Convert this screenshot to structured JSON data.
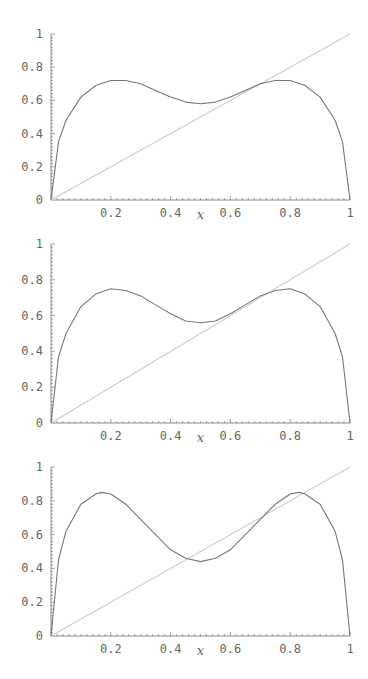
{
  "chart_data": [
    {
      "type": "line",
      "title": "",
      "xlabel": "x",
      "ylabel": "",
      "xlim": [
        0,
        1
      ],
      "ylim": [
        0,
        1
      ],
      "x_ticks": [
        "0.2",
        "0.4",
        "0.6",
        "0.8",
        "1"
      ],
      "y_ticks": [
        "0",
        "0.2",
        "0.4",
        "0.6",
        "0.8",
        "1"
      ],
      "grid": false,
      "series": [
        {
          "name": "f(x)",
          "color": "#777777",
          "x": [
            0,
            0.025,
            0.05,
            0.1,
            0.15,
            0.2,
            0.25,
            0.3,
            0.35,
            0.4,
            0.45,
            0.5,
            0.55,
            0.6,
            0.65,
            0.7,
            0.75,
            0.8,
            0.85,
            0.9,
            0.95,
            0.975,
            1
          ],
          "y": [
            0,
            0.35,
            0.48,
            0.62,
            0.69,
            0.72,
            0.72,
            0.7,
            0.66,
            0.62,
            0.59,
            0.58,
            0.59,
            0.62,
            0.66,
            0.7,
            0.72,
            0.72,
            0.69,
            0.62,
            0.48,
            0.35,
            0
          ]
        },
        {
          "name": "y = x",
          "color": "#cccccc",
          "x": [
            0,
            1
          ],
          "y": [
            0,
            1
          ]
        }
      ]
    },
    {
      "type": "line",
      "title": "",
      "xlabel": "x",
      "ylabel": "",
      "xlim": [
        0,
        1
      ],
      "ylim": [
        0,
        1
      ],
      "x_ticks": [
        "0.2",
        "0.4",
        "0.6",
        "0.8",
        "1"
      ],
      "y_ticks": [
        "0",
        "0.2",
        "0.4",
        "0.6",
        "0.8",
        "1"
      ],
      "grid": false,
      "series": [
        {
          "name": "f(x)",
          "color": "#777777",
          "x": [
            0,
            0.025,
            0.05,
            0.1,
            0.15,
            0.2,
            0.25,
            0.3,
            0.35,
            0.4,
            0.45,
            0.5,
            0.55,
            0.6,
            0.65,
            0.7,
            0.75,
            0.8,
            0.85,
            0.9,
            0.95,
            0.975,
            1
          ],
          "y": [
            0,
            0.37,
            0.5,
            0.65,
            0.72,
            0.75,
            0.74,
            0.71,
            0.66,
            0.61,
            0.57,
            0.56,
            0.57,
            0.61,
            0.66,
            0.71,
            0.74,
            0.75,
            0.72,
            0.65,
            0.5,
            0.37,
            0
          ]
        },
        {
          "name": "y = x",
          "color": "#cccccc",
          "x": [
            0,
            1
          ],
          "y": [
            0,
            1
          ]
        }
      ]
    },
    {
      "type": "line",
      "title": "",
      "xlabel": "x",
      "ylabel": "",
      "xlim": [
        0,
        1
      ],
      "ylim": [
        0,
        1
      ],
      "x_ticks": [
        "0.2",
        "0.4",
        "0.6",
        "0.8",
        "1"
      ],
      "y_ticks": [
        "0",
        "0.2",
        "0.4",
        "0.6",
        "0.8",
        "1"
      ],
      "grid": false,
      "series": [
        {
          "name": "f(x)",
          "color": "#777777",
          "x": [
            0,
            0.025,
            0.05,
            0.1,
            0.15,
            0.17,
            0.2,
            0.25,
            0.3,
            0.35,
            0.4,
            0.45,
            0.5,
            0.55,
            0.6,
            0.65,
            0.7,
            0.75,
            0.8,
            0.83,
            0.85,
            0.9,
            0.95,
            0.975,
            1
          ],
          "y": [
            0,
            0.45,
            0.62,
            0.78,
            0.84,
            0.85,
            0.84,
            0.78,
            0.69,
            0.6,
            0.51,
            0.46,
            0.44,
            0.46,
            0.51,
            0.6,
            0.69,
            0.78,
            0.84,
            0.85,
            0.84,
            0.78,
            0.62,
            0.45,
            0
          ]
        },
        {
          "name": "y = x",
          "color": "#cccccc",
          "x": [
            0,
            1
          ],
          "y": [
            0,
            1
          ]
        }
      ]
    }
  ],
  "layout": {
    "plots": [
      {
        "top": 0,
        "y0": 200,
        "y1": 34
      },
      {
        "top": 0,
        "y0": 423,
        "y1": 244
      },
      {
        "top": 0,
        "y0": 636,
        "y1": 467
      }
    ],
    "x0": 51,
    "x1": 350,
    "axis_color": "#888888",
    "label_color": "#666666"
  }
}
